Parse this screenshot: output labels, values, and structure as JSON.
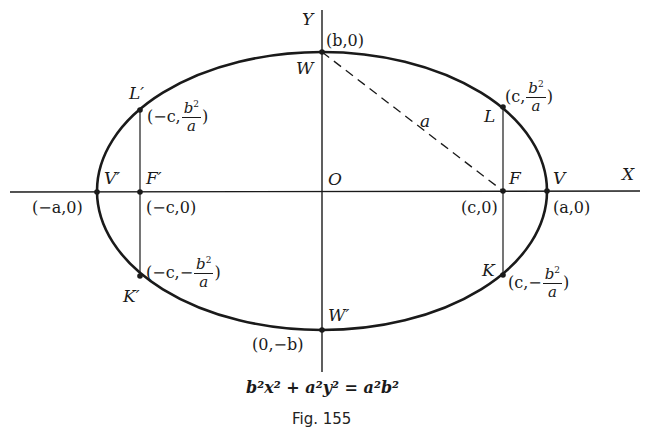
{
  "figure": {
    "caption": "Fig. 155",
    "equation": "b²x² + a²y² = a²b²",
    "axes": {
      "x_label": "X",
      "y_label": "Y",
      "origin_label": "O"
    },
    "labels": {
      "W": "W",
      "W_prime": "W′",
      "V": "V",
      "V_prime": "V′",
      "F": "F",
      "F_prime": "F′",
      "L": "L",
      "L_prime": "L′",
      "K": "K",
      "K_prime": "K′",
      "a": "a"
    },
    "coordinates": {
      "W": "(b,0)",
      "W_prime": "(0,−b)",
      "V": "(a,0)",
      "V_prime": "(−a,0)",
      "F": "(c,0)",
      "F_prime": "(−c,0)",
      "L": {
        "prefix": "(c,",
        "num": "b",
        "sup": "2",
        "den": "a",
        "suffix": ")"
      },
      "L_prime": {
        "prefix": "(−c,",
        "num": "b",
        "sup": "2",
        "den": "a",
        "suffix": ")"
      },
      "K": {
        "prefix": "(c,−",
        "num": "b",
        "sup": "2",
        "den": "a",
        "suffix": ")"
      },
      "K_prime": {
        "prefix": "(−c,−",
        "num": "b",
        "sup": "2",
        "den": "a",
        "suffix": ")"
      }
    },
    "colors": {
      "ink": "#1a1a1a",
      "background": "#ffffff"
    }
  }
}
